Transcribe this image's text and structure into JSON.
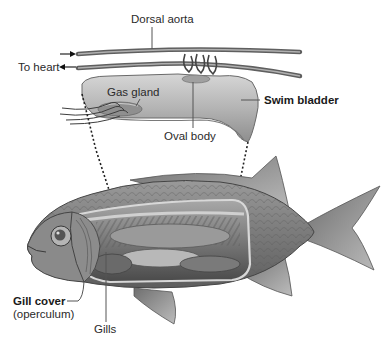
{
  "diagram": {
    "labels": {
      "dorsal_aorta": "Dorsal aorta",
      "to_heart": "To heart",
      "gas_gland": "Gas gland",
      "swim_bladder": "Swim bladder",
      "oval_body": "Oval body",
      "gill_cover": "Gill cover",
      "operculum": "(operculum)",
      "gills": "Gills"
    },
    "arrows": {
      "inflow": "→",
      "outflow": "←"
    },
    "colors": {
      "background": "#ffffff",
      "label_text": "#2a2a2a",
      "vessel": "#6e6e6e",
      "bladder_fill": "#bdbdbd",
      "fish_body": "#8a8a8a",
      "leader_line": "#555555"
    }
  }
}
